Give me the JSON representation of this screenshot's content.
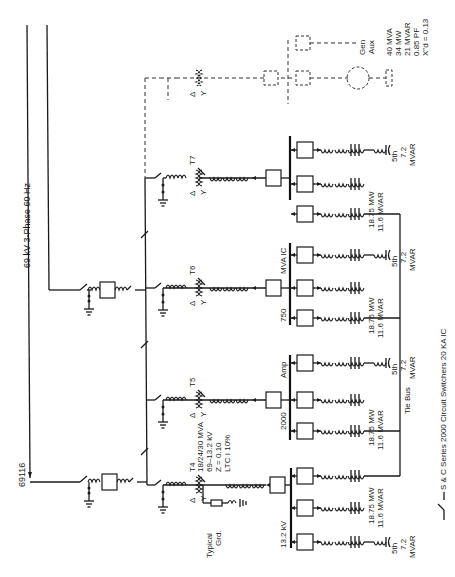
{
  "diagram": {
    "title": "69 kV 3-Phase 60 Hz",
    "source_label": "69116",
    "orientation": "rotated 90 degrees counter-clockwise",
    "transformers": [
      {
        "id": "T4",
        "rating": "18/24/30 MVA",
        "voltage": "69–13.2 kV",
        "impedance": "Z = 0.10",
        "ltc": "LTC ì 10%",
        "grounding_label": "Typical Grd.",
        "primary": "Δ",
        "secondary": "Y"
      },
      {
        "id": "T5",
        "primary": "Δ",
        "secondary": "Y"
      },
      {
        "id": "T6",
        "primary": "Δ",
        "secondary": "Y"
      },
      {
        "id": "T7",
        "primary": "Δ",
        "secondary": "Y"
      },
      {
        "id": "future",
        "primary": "Δ",
        "secondary": "Y",
        "dashed": true
      }
    ],
    "bus": {
      "voltage_label": "13.2 kV",
      "rating_label_1": "2000",
      "rating_label_2": "Amp",
      "ic_label_1": "750",
      "ic_label_2": "MVA IC",
      "tie_label": "Tie Bus"
    },
    "feeder_load": {
      "mw": "18.75 MW",
      "mvar": "11.6 MVAR"
    },
    "capacitor": {
      "filter": "5th",
      "size": "7.2",
      "unit": "MVAR"
    },
    "generator": {
      "aux_label_1": "Gen",
      "aux_label_2": "Aux",
      "mva": "40 MVA",
      "mw": "34 MW",
      "mvar": "21 MVAR",
      "pf": "0.85 PF",
      "xd": "X″d = 0.13"
    },
    "legend": {
      "switcher_note": "S & C Series 2000 Circuit Switchers 20 KA IC"
    }
  }
}
